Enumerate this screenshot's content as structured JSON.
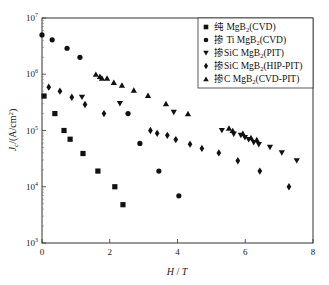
{
  "chart_data": {
    "type": "scatter",
    "title": "",
    "xlabel": "H / T",
    "ylabel": "J_c/(A/cm²)",
    "xlim": [
      0,
      8
    ],
    "ylim": [
      1000,
      10000000
    ],
    "yscale": "log",
    "x_ticks": [
      "0",
      "2",
      "4",
      "6",
      "8"
    ],
    "y_ticks": [
      "10^7",
      "10^6",
      "10^5",
      "10^4",
      "10^3"
    ],
    "grid": false,
    "legend_position": "upper right",
    "series": [
      {
        "name": "纯 MgB₂(CVD)",
        "marker": "square",
        "x": [
          0.06,
          0.38,
          0.65,
          0.83,
          1.21,
          1.65,
          2.15,
          2.39
        ],
        "y": [
          410000,
          200000,
          100000,
          70000,
          39000,
          19000,
          10000,
          4800
        ]
      },
      {
        "name": "掺 Ti MgB₂(CVD)",
        "marker": "circle",
        "x": [
          0.0,
          0.3,
          0.74,
          1.12,
          2.54,
          2.89,
          3.45,
          4.04
        ],
        "y": [
          5000000,
          4100000,
          2900000,
          2000000,
          200000,
          59000,
          19000,
          6900
        ]
      },
      {
        "name": "掺SiC MgB₂(PIT)",
        "marker": "triangle-down",
        "x": [
          1.18,
          2.3,
          3.89,
          5.31,
          5.66,
          5.87,
          5.99,
          6.1,
          6.25,
          6.4,
          6.73,
          7.08,
          7.52
        ],
        "y": [
          390000,
          300000,
          210000,
          100000,
          86000,
          82000,
          75000,
          69000,
          61000,
          56000,
          50000,
          40000,
          29000
        ]
      },
      {
        "name": "掺SiC MgB₂(HIP-PIT)",
        "marker": "diamond",
        "x": [
          0.2,
          0.53,
          0.88,
          1.27,
          1.83,
          3.2,
          3.4,
          3.7,
          3.95,
          4.37,
          4.72,
          5.22,
          5.78,
          6.43,
          7.29
        ],
        "y": [
          590000,
          500000,
          390000,
          290000,
          200000,
          100000,
          89000,
          82000,
          69000,
          57000,
          48000,
          40000,
          29000,
          19000,
          10000
        ]
      },
      {
        "name": "掺C MgB₂(CVD-PIT)",
        "marker": "triangle-up",
        "x": [
          1.59,
          1.71,
          1.77,
          1.92,
          2.12,
          2.36,
          2.71,
          3.13,
          3.66,
          4.31,
          5.52,
          5.63,
          5.93,
          6.17,
          6.34
        ],
        "y": [
          1000000,
          920000,
          850000,
          850000,
          720000,
          640000,
          520000,
          420000,
          300000,
          200000,
          110000,
          100000,
          89000,
          75000,
          69000
        ]
      }
    ]
  },
  "axes": {
    "x_title_main": "H",
    "x_title_sep": " / ",
    "x_title_unit": "T",
    "y_title": "J_c/(A/cm²)",
    "x_ticks": [
      "0",
      "2",
      "4",
      "6",
      "8"
    ],
    "y_ticks": [
      {
        "base": "10",
        "exp": "7"
      },
      {
        "base": "10",
        "exp": "6"
      },
      {
        "base": "10",
        "exp": "5"
      },
      {
        "base": "10",
        "exp": "4"
      },
      {
        "base": "10",
        "exp": "3"
      }
    ]
  },
  "legend": {
    "items": [
      {
        "prefix": "纯 MgB",
        "sub": "2",
        "suffix": "(CVD)"
      },
      {
        "prefix": "掺 Ti MgB",
        "sub": "2",
        "suffix": "(CVD)"
      },
      {
        "prefix": "掺SiC MgB",
        "sub": "2",
        "suffix": "(PIT)"
      },
      {
        "prefix": "掺SiC MgB",
        "sub": "2",
        "suffix": "(HIP-PIT)"
      },
      {
        "prefix": "掺C MgB",
        "sub": "2",
        "suffix": "(CVD-PIT)"
      }
    ]
  }
}
